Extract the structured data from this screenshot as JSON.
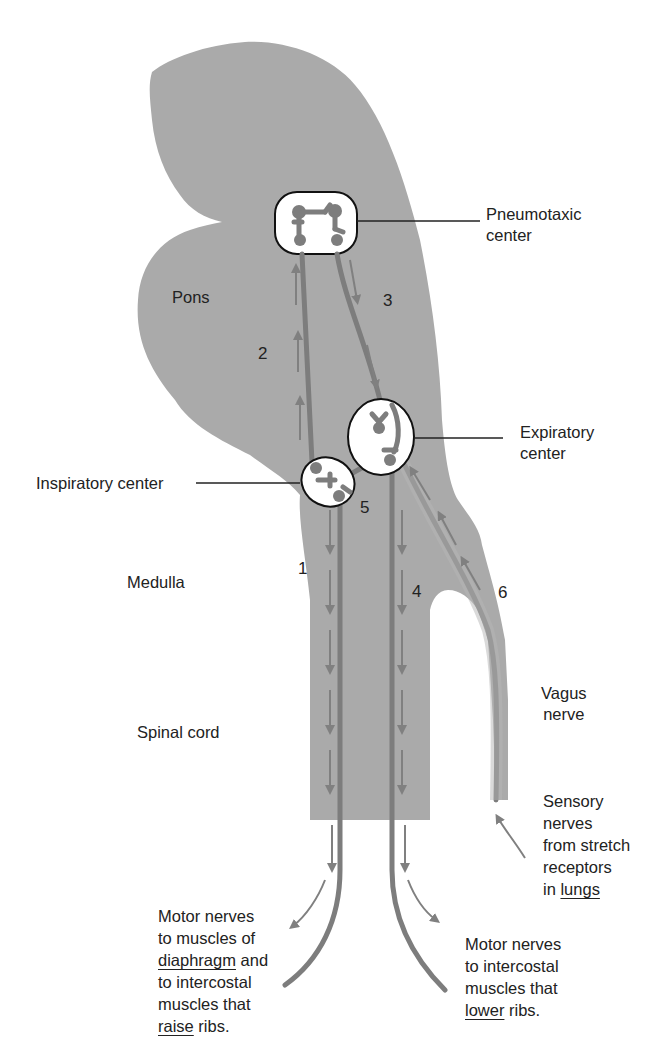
{
  "diagram": {
    "colors": {
      "tissue": "#aaaaaa",
      "nerve": "#7d7d7d",
      "arrow": "#808080",
      "outline": "#111111",
      "background": "#ffffff"
    },
    "regions": {
      "pons": "Pons",
      "medulla": "Medulla",
      "spinal_cord": "Spinal cord"
    },
    "centers": {
      "pneumotaxic": {
        "line1": "Pneumotaxic",
        "line2": "center"
      },
      "expiratory": {
        "line1": "Expiratory",
        "line2": "center"
      },
      "inspiratory": "Inspiratory center"
    },
    "vagus": {
      "line1": "Vagus",
      "line2": "nerve"
    },
    "pathway_numbers": [
      "1",
      "2",
      "3",
      "4",
      "5",
      "6"
    ],
    "sensory": {
      "line1": "Sensory",
      "line2": "nerves",
      "line3": "from stretch",
      "line4": "receptors",
      "line5_prefix": "in ",
      "line5_underlined": "lungs"
    },
    "motor_left": {
      "line1": "Motor nerves",
      "line2": "to muscles of",
      "line3_underlined": "diaphragm",
      "line3_suffix": " and",
      "line4": "to intercostal",
      "line5": "muscles that",
      "line6_underlined": "raise",
      "line6_suffix": " ribs."
    },
    "motor_right": {
      "line1": "Motor nerves",
      "line2": "to intercostal",
      "line3": "muscles that",
      "line4_underlined": "lower",
      "line4_suffix": " ribs."
    }
  }
}
